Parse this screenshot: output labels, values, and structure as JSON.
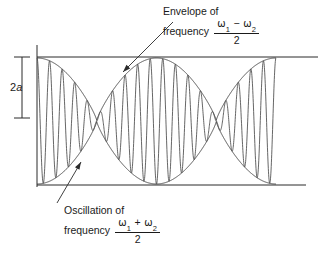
{
  "figure": {
    "background_color": "#ffffff",
    "stroke_color": "#2b2b2b",
    "text_color": "#1a1a1a",
    "width": 327,
    "height": 259
  },
  "annotations": {
    "envelope": {
      "line1": "Envelope of",
      "line2": "frequency",
      "numerator_left": "ω",
      "numerator_left_sub": "1",
      "operator": "−",
      "numerator_right": "ω",
      "numerator_right_sub": "2",
      "denominator": "2",
      "x": 163,
      "y": 5
    },
    "oscillation": {
      "line1": "Oscillation of",
      "line2": "frequency",
      "numerator_left": "ω",
      "numerator_left_sub": "1",
      "operator": "+",
      "numerator_right": "ω",
      "numerator_right_sub": "2",
      "denominator": "2",
      "x": 64,
      "y": 204
    },
    "amplitude_label": {
      "number": "2",
      "symbol": "a",
      "x": 10,
      "y": 81
    }
  },
  "geometry": {
    "axis_x": 37,
    "top_line_y": 57,
    "bottom_line_y": 185,
    "top_line_x2": 318,
    "bottom_line_x2": 306,
    "axis_top_y": 45,
    "axis_bottom_y": 187,
    "dim_x": 22,
    "dim_top_y": 57,
    "dim_bottom_y": 118,
    "dim_tick_half": 8,
    "wave_x_start": 37,
    "wave_x_end": 276,
    "envelope_cross_x": 167,
    "envelope_cross_y": 120,
    "arrow_envelope": {
      "x1": 173,
      "y1": 22,
      "x2": 123,
      "y2": 72
    },
    "arrow_oscillation": {
      "x1": 57,
      "y1": 203,
      "x2": 81,
      "y2": 162
    }
  },
  "chart_data": {
    "type": "line",
    "xlabel": "",
    "ylabel": "",
    "amplitude_label": "2a",
    "carrier_cycles": 19,
    "envelope_cycles": 2,
    "baseline_y": 185,
    "top_y": 57,
    "center_y": 121,
    "half_amplitude": 64,
    "x_domain": [
      37,
      276
    ],
    "envelope_shape": "rectified-sinusoid",
    "grid": false,
    "legend": null,
    "reference_lines": [
      {
        "name": "upper-bound",
        "y": 57,
        "x1": 37,
        "x2": 318
      },
      {
        "name": "lower-bound",
        "y": 185,
        "x1": 37,
        "x2": 306
      }
    ]
  }
}
